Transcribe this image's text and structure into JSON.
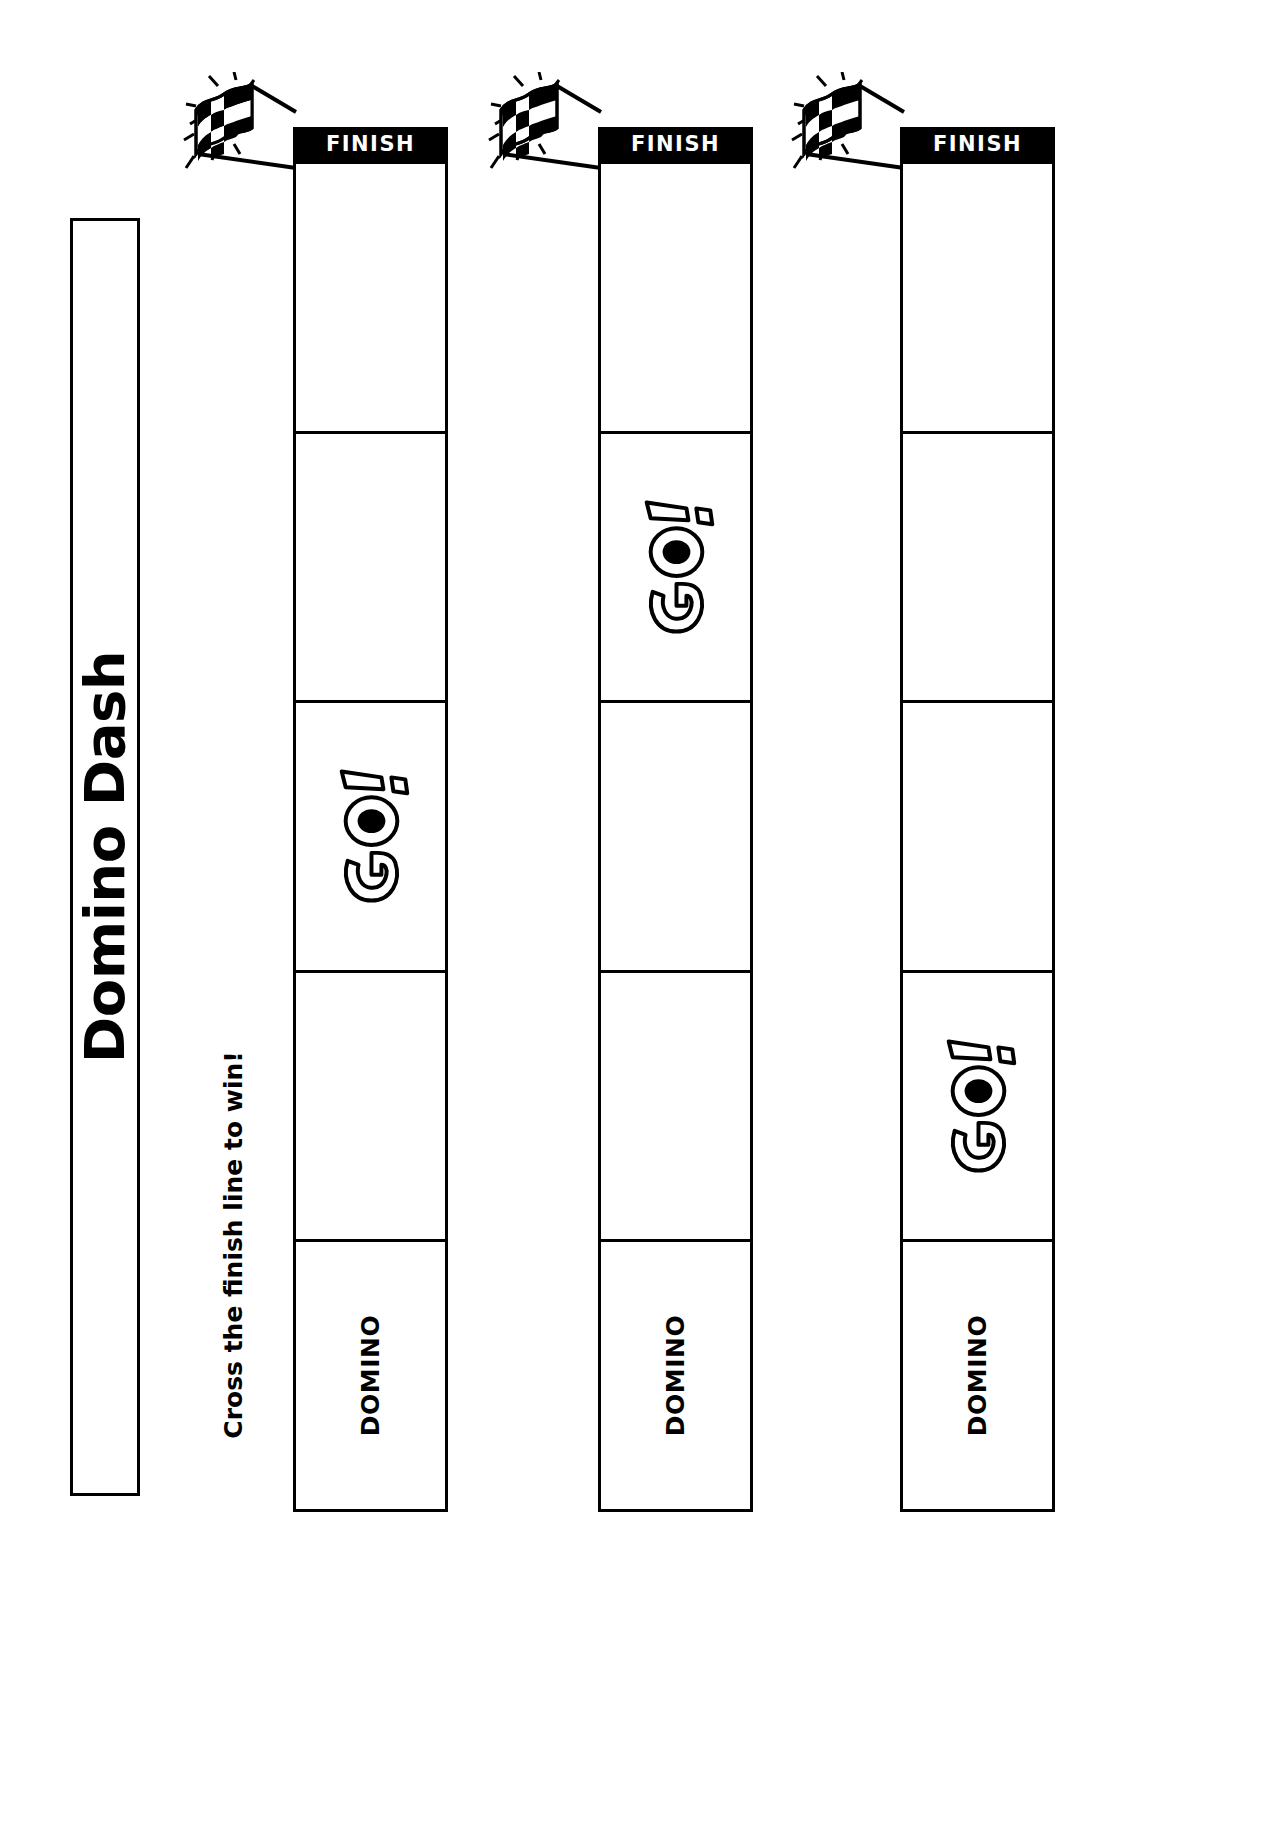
{
  "worksheet": {
    "title": "Domino Dash",
    "subtitle": "Cross the finish line to win!",
    "finish_label": "FINISH",
    "go_label": "GO!",
    "domino_label": "DOMINO",
    "ink_color": "#000000",
    "paper_color": "#ffffff"
  },
  "icons": {
    "checkered_flag": "checkered-flag-icon",
    "go_starburst": "go-text-icon"
  },
  "tracks": [
    {
      "id": 1,
      "finish_label": "FINISH",
      "cells": [
        {
          "label": "",
          "type": "blank"
        },
        {
          "label": "",
          "type": "blank"
        },
        {
          "label": "GO!",
          "type": "go"
        },
        {
          "label": "",
          "type": "blank"
        },
        {
          "label": "DOMINO",
          "type": "text"
        }
      ]
    },
    {
      "id": 2,
      "finish_label": "FINISH",
      "cells": [
        {
          "label": "",
          "type": "blank"
        },
        {
          "label": "GO!",
          "type": "go"
        },
        {
          "label": "",
          "type": "blank"
        },
        {
          "label": "",
          "type": "blank"
        },
        {
          "label": "DOMINO",
          "type": "text"
        }
      ]
    },
    {
      "id": 3,
      "finish_label": "FINISH",
      "cells": [
        {
          "label": "",
          "type": "blank"
        },
        {
          "label": "",
          "type": "blank"
        },
        {
          "label": "",
          "type": "blank"
        },
        {
          "label": "GO!",
          "type": "go"
        },
        {
          "label": "DOMINO",
          "type": "text"
        }
      ]
    }
  ]
}
